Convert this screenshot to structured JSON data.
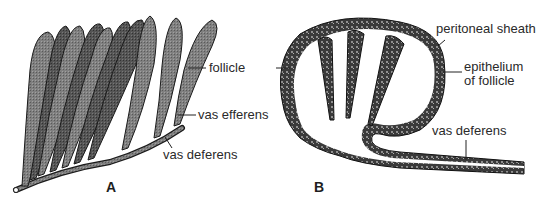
{
  "figure": {
    "panels": [
      {
        "id": "A",
        "label": "A"
      },
      {
        "id": "B",
        "label": "B"
      }
    ],
    "labels": {
      "follicle": "follicle",
      "vas_efferens": "vas efferens",
      "vas_deferens_a": "vas deferens",
      "peritoneal_sheath": "peritoneal sheath",
      "epithelium_line1": "epithelium",
      "epithelium_line2": "of follicle",
      "vas_deferens_b": "vas deferens"
    },
    "colors": {
      "follicle_fill": "#7a7a7a",
      "follicle_dark": "#4a4a4a",
      "outline": "#1a1a1a",
      "text": "#2a2a2a",
      "background": "#ffffff"
    }
  }
}
